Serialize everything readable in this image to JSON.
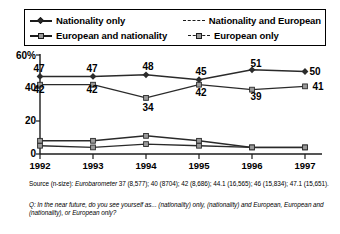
{
  "legend": {
    "items": [
      {
        "label": "Nationality only",
        "style": "solid-diamond",
        "icon": "line-marker-diamond-icon"
      },
      {
        "label": "Nationality and European",
        "style": "dashed",
        "icon": "line-dashed-icon"
      },
      {
        "label": "European and nationality",
        "style": "solid-square",
        "icon": "line-marker-square-icon"
      },
      {
        "label": "European only",
        "style": "dashed-marker",
        "icon": "line-dashed-marker-icon"
      }
    ]
  },
  "axes": {
    "y_ticks": [
      "60%",
      "40",
      "20",
      "0"
    ],
    "x_ticks": [
      "1992",
      "1993",
      "1994",
      "1995",
      "1996",
      "1997"
    ]
  },
  "footnotes": {
    "source_prefix": "Source (n-size): ",
    "source_italic": "Eurobarometer",
    "source_rest": " 37 (8,577); 40 (8704); 42 (8,686); 44.1 (16,565); 46 (15,834); 47.1 (15,651).",
    "question": "Q: In the near future, do you see yourself as... (nationality) only, (nationality) and European, European and (nationality), or European only?"
  },
  "chart_data": {
    "type": "line",
    "title": "",
    "xlabel": "",
    "ylabel": "",
    "ylim": [
      0,
      60
    ],
    "yticks": [
      0,
      20,
      40,
      60
    ],
    "grid": false,
    "legend_position": "top",
    "x": [
      "1992",
      "1993",
      "1994",
      "1995",
      "1996",
      "1997"
    ],
    "series": [
      {
        "name": "Nationality only",
        "values": [
          47,
          47,
          48,
          45,
          51,
          50
        ],
        "style": "solid-diamond"
      },
      {
        "name": "Nationality and European",
        "values": [
          42,
          42,
          34,
          42,
          39,
          41
        ],
        "style": "dashed"
      },
      {
        "name": "European and nationality",
        "values": [
          8,
          8,
          11,
          8,
          4,
          4
        ],
        "style": "solid-square"
      },
      {
        "name": "European only",
        "values": [
          5,
          4,
          6,
          5,
          4,
          4
        ],
        "style": "dashed-marker"
      }
    ],
    "data_labels": {
      "Nationality only": [
        "47",
        "47",
        "48",
        "45",
        "51",
        "50"
      ],
      "Nationality and European": [
        "42",
        "42",
        "34",
        "42",
        "39",
        "41"
      ]
    }
  }
}
